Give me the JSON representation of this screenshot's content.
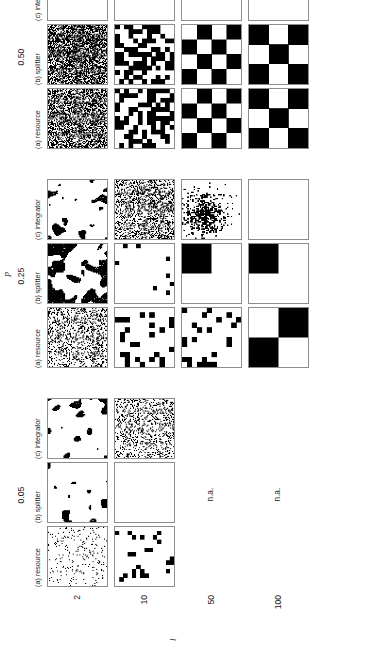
{
  "figure": {
    "type": "panel-grid-binary-patterns",
    "orientation": "rotated-90-ccw",
    "axis_labels": {
      "columns_axis_symbol": "p",
      "rows_axis_symbol": "l"
    }
  },
  "columns": {
    "groups": [
      {
        "p_value": "0.05",
        "subpanels": [
          {
            "key": "resource",
            "label": "(a) resource"
          },
          {
            "key": "splitter",
            "label": "(b) splitter"
          },
          {
            "key": "integrator",
            "label": "(c) integrator"
          }
        ]
      },
      {
        "p_value": "0.25",
        "subpanels": [
          {
            "key": "resource",
            "label": "(a) resource"
          },
          {
            "key": "splitter",
            "label": "(b) splitter"
          },
          {
            "key": "integrator",
            "label": "(c) integrator"
          }
        ]
      },
      {
        "p_value": "0.50",
        "subpanels": [
          {
            "key": "resource",
            "label": "(a) resource"
          },
          {
            "key": "splitter",
            "label": "(b) splitter"
          },
          {
            "key": "integrator",
            "label": "(c) integrator"
          }
        ]
      }
    ]
  },
  "rows": {
    "values": [
      "2",
      "10",
      "50",
      "100"
    ]
  },
  "not_available_label": "n.a.",
  "chart_data": {
    "type": "heatmap",
    "title": "",
    "xlabel": "p",
    "ylabel": "l",
    "categories_x": [
      "0.05",
      "0.25",
      "0.50"
    ],
    "categories_y": [
      "2",
      "10",
      "50",
      "100"
    ],
    "series": [
      {
        "name": "(a) resource",
        "role": "column-a"
      },
      {
        "name": "(b) splitter",
        "role": "column-b"
      },
      {
        "name": "(c) integrator",
        "role": "column-c"
      }
    ],
    "cells": [
      {
        "p": "0.05",
        "l": "2",
        "panel": "resource",
        "kind": "speckle",
        "density": 0.06,
        "block": 2,
        "available": true
      },
      {
        "p": "0.05",
        "l": "2",
        "panel": "splitter",
        "kind": "cluster",
        "density": 0.05,
        "block": 2,
        "available": true
      },
      {
        "p": "0.05",
        "l": "2",
        "panel": "integrator",
        "kind": "cluster",
        "density": 0.09,
        "block": 2,
        "available": true
      },
      {
        "p": "0.05",
        "l": "10",
        "panel": "resource",
        "kind": "sparse",
        "density": 0.05,
        "block": 10,
        "available": true
      },
      {
        "p": "0.05",
        "l": "10",
        "panel": "splitter",
        "kind": "empty",
        "density": 0.0,
        "block": 10,
        "available": true
      },
      {
        "p": "0.05",
        "l": "10",
        "panel": "integrator",
        "kind": "speckle",
        "density": 0.22,
        "block": 4,
        "available": true
      },
      {
        "p": "0.05",
        "l": "50",
        "panel": "resource",
        "kind": "na",
        "density": 0.0,
        "block": 50,
        "available": false
      },
      {
        "p": "0.05",
        "l": "50",
        "panel": "splitter",
        "kind": "na",
        "density": 0.0,
        "block": 50,
        "available": false
      },
      {
        "p": "0.05",
        "l": "50",
        "panel": "integrator",
        "kind": "na",
        "density": 0.0,
        "block": 50,
        "available": false
      },
      {
        "p": "0.05",
        "l": "100",
        "panel": "resource",
        "kind": "na",
        "density": 0.0,
        "block": 100,
        "available": false
      },
      {
        "p": "0.05",
        "l": "100",
        "panel": "splitter",
        "kind": "na",
        "density": 0.0,
        "block": 100,
        "available": false
      },
      {
        "p": "0.05",
        "l": "100",
        "panel": "integrator",
        "kind": "na",
        "density": 0.0,
        "block": 100,
        "available": false
      },
      {
        "p": "0.25",
        "l": "2",
        "panel": "resource",
        "kind": "speckle",
        "density": 0.26,
        "block": 2,
        "available": true
      },
      {
        "p": "0.25",
        "l": "2",
        "panel": "splitter",
        "kind": "cluster",
        "density": 0.4,
        "block": 2,
        "available": true
      },
      {
        "p": "0.25",
        "l": "2",
        "panel": "integrator",
        "kind": "cluster",
        "density": 0.1,
        "block": 2,
        "available": true
      },
      {
        "p": "0.25",
        "l": "10",
        "panel": "resource",
        "kind": "blocky",
        "density": 0.24,
        "block": 10,
        "available": true
      },
      {
        "p": "0.25",
        "l": "10",
        "panel": "splitter",
        "kind": "sparse",
        "density": 0.04,
        "block": 10,
        "available": true
      },
      {
        "p": "0.25",
        "l": "10",
        "panel": "integrator",
        "kind": "speckle",
        "density": 0.33,
        "block": 4,
        "available": true
      },
      {
        "p": "0.25",
        "l": "50",
        "panel": "resource",
        "kind": "blocky",
        "density": 0.18,
        "block": 50,
        "available": true
      },
      {
        "p": "0.25",
        "l": "50",
        "panel": "splitter",
        "kind": "quad",
        "density": 0.25,
        "block": 50,
        "available": true
      },
      {
        "p": "0.25",
        "l": "50",
        "panel": "integrator",
        "kind": "patch",
        "density": 0.2,
        "block": 12,
        "available": true
      },
      {
        "p": "0.25",
        "l": "100",
        "panel": "resource",
        "kind": "quad",
        "density": 0.25,
        "block": 100,
        "available": true
      },
      {
        "p": "0.25",
        "l": "100",
        "panel": "splitter",
        "kind": "quad",
        "density": 0.25,
        "block": 100,
        "available": true
      },
      {
        "p": "0.25",
        "l": "100",
        "panel": "integrator",
        "kind": "empty",
        "density": 0.0,
        "block": 100,
        "available": true
      },
      {
        "p": "0.50",
        "l": "2",
        "panel": "resource",
        "kind": "speckle",
        "density": 0.5,
        "block": 2,
        "available": true
      },
      {
        "p": "0.50",
        "l": "2",
        "panel": "splitter",
        "kind": "speckle",
        "density": 0.58,
        "block": 2,
        "available": true
      },
      {
        "p": "0.50",
        "l": "2",
        "panel": "integrator",
        "kind": "empty",
        "density": 0.0,
        "block": 2,
        "available": true
      },
      {
        "p": "0.50",
        "l": "10",
        "panel": "resource",
        "kind": "maze",
        "density": 0.5,
        "block": 10,
        "available": true
      },
      {
        "p": "0.50",
        "l": "10",
        "panel": "splitter",
        "kind": "maze",
        "density": 0.5,
        "block": 10,
        "available": true
      },
      {
        "p": "0.50",
        "l": "10",
        "panel": "integrator",
        "kind": "empty",
        "density": 0.0,
        "block": 10,
        "available": true
      },
      {
        "p": "0.50",
        "l": "50",
        "panel": "resource",
        "kind": "checker",
        "density": 0.5,
        "block": 50,
        "available": true
      },
      {
        "p": "0.50",
        "l": "50",
        "panel": "splitter",
        "kind": "checker",
        "density": 0.5,
        "block": 50,
        "available": true
      },
      {
        "p": "0.50",
        "l": "50",
        "panel": "integrator",
        "kind": "empty",
        "density": 0.0,
        "block": 50,
        "available": true
      },
      {
        "p": "0.50",
        "l": "100",
        "panel": "resource",
        "kind": "checker",
        "density": 0.5,
        "block": 100,
        "available": true
      },
      {
        "p": "0.50",
        "l": "100",
        "panel": "splitter",
        "kind": "checker",
        "density": 0.5,
        "block": 100,
        "available": true
      },
      {
        "p": "0.50",
        "l": "100",
        "panel": "integrator",
        "kind": "empty",
        "density": 0.0,
        "block": 100,
        "available": true
      }
    ],
    "colors": {
      "on": "#000000",
      "off": "#ffffff",
      "frame": "#8d8d8d"
    },
    "grid": false,
    "legend": "none"
  }
}
